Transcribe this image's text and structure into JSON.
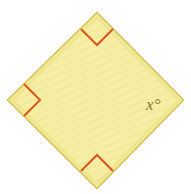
{
  "figure": {
    "type": "geometry-diagram",
    "shape_name": "square-rotated-45",
    "background_color": "#ffffff",
    "canvas": {
      "width": 191,
      "height": 194
    },
    "polygon": {
      "fill_color": "#f6eea4",
      "stroke_color": "#c6b43c",
      "stroke_width": 2,
      "points": "97,13 183,100 97,188 8,100",
      "vertices": [
        {
          "name": "top",
          "x": 97,
          "y": 13
        },
        {
          "name": "right",
          "x": 183,
          "y": 100
        },
        {
          "name": "bottom",
          "x": 97,
          "y": 188
        },
        {
          "name": "left",
          "x": 8,
          "y": 100
        }
      ]
    },
    "right_angle_marks": {
      "color": "#db551c",
      "stroke_width": 2,
      "count": 3,
      "marks": [
        {
          "at_vertex": "top",
          "points": "81,29 97,45 113,29"
        },
        {
          "at_vertex": "left",
          "points": "24,84 40,100 24,116"
        },
        {
          "at_vertex": "bottom",
          "points": "81,171 97,155 113,171"
        }
      ]
    },
    "labels": [
      {
        "id": "unknown-angle",
        "variable": "x",
        "degree_symbol": "°",
        "text": "x°",
        "color": "#8a7a2e",
        "at_vertex": "right",
        "x": 146,
        "y": 110
      }
    ],
    "texture": {
      "visible": true,
      "line_color": "#efe58f",
      "orientation": "diagonal"
    }
  }
}
